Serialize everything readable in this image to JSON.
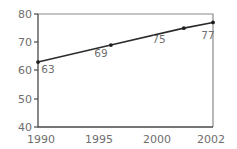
{
  "chart_data": {
    "type": "line",
    "title": "",
    "subtitle": "",
    "xlabel": "",
    "ylabel": "",
    "x": [
      1990,
      1995,
      2000,
      2002
    ],
    "categories": [
      "1990",
      "1995",
      "2000",
      "2002"
    ],
    "values": [
      63,
      69,
      75,
      77
    ],
    "series": [
      {
        "name": "",
        "values": [
          63,
          69,
          75,
          77
        ]
      }
    ],
    "point_labels": [
      "63",
      "69",
      "75",
      "77"
    ],
    "xlim": [
      1990,
      2002
    ],
    "ylim": [
      40,
      80
    ],
    "yticks": [
      40,
      50,
      60,
      70,
      80
    ],
    "ytick_labels": [
      "40",
      "50",
      "60",
      "70",
      "80"
    ],
    "xticks": [
      1990,
      1995,
      2000,
      2002
    ],
    "xtick_labels": [
      "1990",
      "1995",
      "2000",
      "2002"
    ],
    "grid": false,
    "legend": false,
    "legend_position": "none",
    "marker": "circle",
    "colors": {
      "line": "#2b2b2b",
      "marker": "#1e1e1e",
      "frame": "#8a8a8a",
      "axis": "#4a4a4a",
      "tick_label": "#6e6e6e",
      "point_label": "#707070",
      "background": "#ffffff"
    }
  },
  "axes": {
    "y": {
      "ticks": [
        {
          "label": "80",
          "value": 80
        },
        {
          "label": "70",
          "value": 70
        },
        {
          "label": "60",
          "value": 60
        },
        {
          "label": "50",
          "value": 50
        },
        {
          "label": "40",
          "value": 40
        }
      ]
    },
    "x": {
      "ticks": [
        {
          "label": "1990",
          "value": 1990
        },
        {
          "label": "1995",
          "value": 1995
        },
        {
          "label": "2000",
          "value": 2000
        },
        {
          "label": "2002",
          "value": 2002
        }
      ]
    }
  },
  "points": [
    {
      "label": "63",
      "x": 1990,
      "y": 63
    },
    {
      "label": "69",
      "x": 1995,
      "y": 69
    },
    {
      "label": "75",
      "x": 2000,
      "y": 75
    },
    {
      "label": "77",
      "x": 2002,
      "y": 77
    }
  ]
}
